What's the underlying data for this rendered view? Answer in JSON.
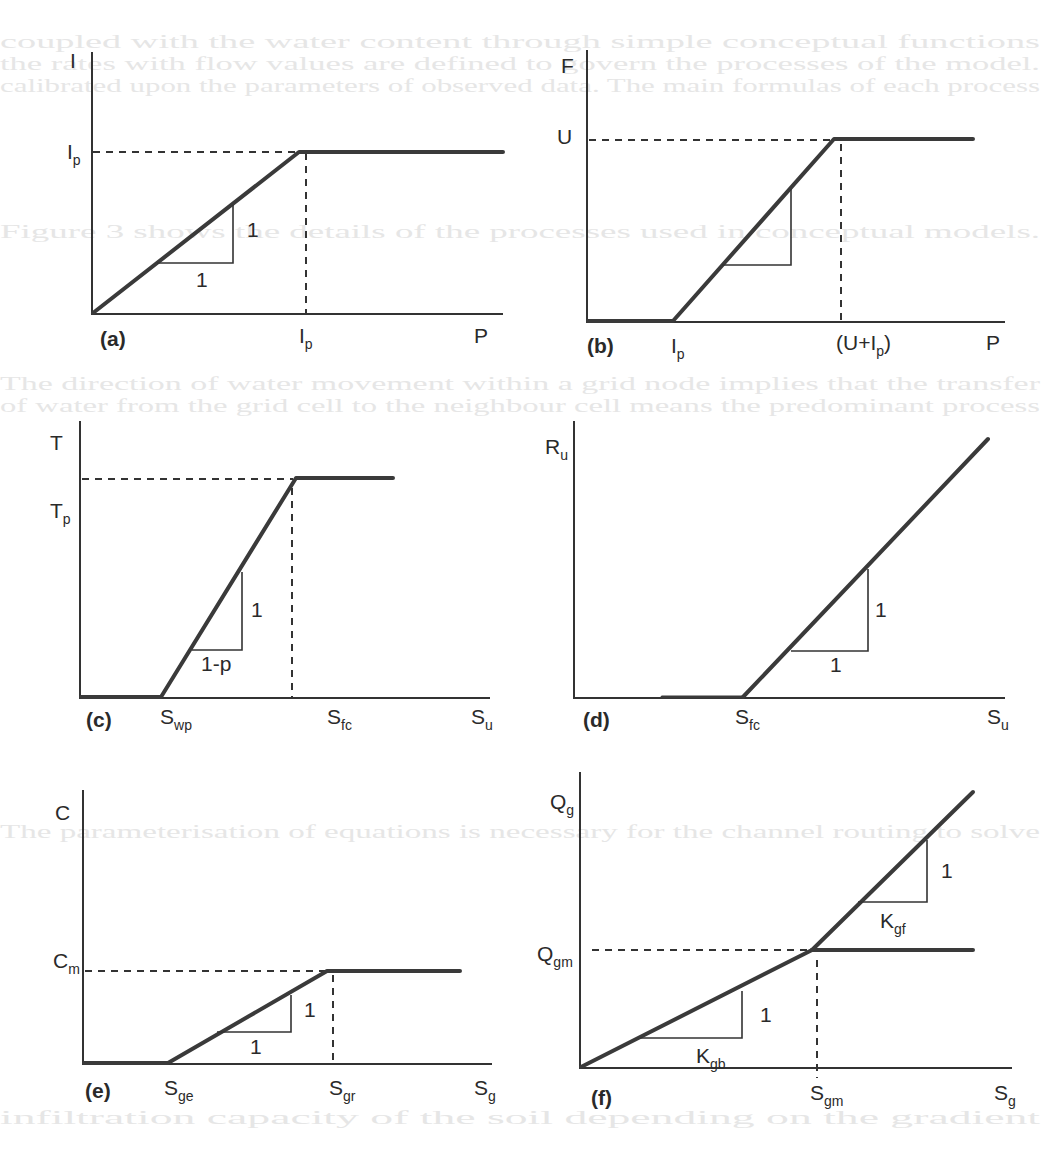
{
  "background_bleed": [
    {
      "x": 0,
      "y": 48,
      "text": "coupled with the water content through simple conceptual functions"
    },
    {
      "x": 0,
      "y": 70,
      "text": "the rates with flow values are defined to govern the processes of the model."
    },
    {
      "x": 0,
      "y": 92,
      "text": "calibrated upon the parameters of observed data. The main formulas of each process"
    },
    {
      "x": 0,
      "y": 238,
      "text": "Figure 3 shows the details of the processes used in conceptual models."
    },
    {
      "x": 0,
      "y": 390,
      "text": "The direction of water movement within a grid node implies that the transfer"
    },
    {
      "x": 0,
      "y": 412,
      "text": "of water from the grid cell to the neighbour cell means the predominant process"
    },
    {
      "x": 0,
      "y": 838,
      "text": "The parameterisation of equations is necessary for the channel routing to solve"
    },
    {
      "x": 0,
      "y": 1124,
      "text": "infiltration capacity of the soil depending on the gradient"
    }
  ],
  "chart_data": [
    {
      "id": "a",
      "type": "line",
      "panel_label": "(a)",
      "ylabel": "I",
      "xlabel": "P",
      "y_ticks": [
        {
          "label": "I",
          "sub": "p"
        }
      ],
      "x_ticks": [
        {
          "label": "I",
          "sub": "p"
        }
      ],
      "description": "Interception I vs precipitation P: slope 1 from origin until I = Ip at P = Ip, then constant Ip",
      "points": [
        [
          0,
          0
        ],
        [
          1,
          1
        ],
        [
          1.65,
          1
        ]
      ],
      "slope_triangles": [
        {
          "rise": "1",
          "run": "1"
        }
      ],
      "xlim": [
        0,
        1.7
      ],
      "ylim": [
        0,
        1.35
      ]
    },
    {
      "id": "b",
      "type": "line",
      "panel_label": "(b)",
      "ylabel": "F",
      "xlabel": "P",
      "y_ticks": [
        {
          "label": "U",
          "sub": ""
        }
      ],
      "x_ticks": [
        {
          "label": "I",
          "sub": "p"
        },
        {
          "label": "(U+I",
          "sub": "p",
          "suffix": ")"
        }
      ],
      "description": "Infiltration F vs precipitation P: zero until P = Ip, slope 1 until F = U at P = U+Ip, then constant U",
      "points": [
        [
          0,
          0
        ],
        [
          0.35,
          0
        ],
        [
          1,
          1
        ],
        [
          1.6,
          1
        ]
      ],
      "slope_triangles": [
        {
          "rise": "",
          "run": ""
        }
      ],
      "xlim": [
        0,
        1.7
      ],
      "ylim": [
        0,
        1.2
      ]
    },
    {
      "id": "c",
      "type": "line",
      "panel_label": "(c)",
      "ylabel": "T",
      "xlabel": "S",
      "y_ticks": [
        {
          "label": "T",
          "sub": "p"
        }
      ],
      "x_ticks": [
        {
          "label": "S",
          "sub": "wp"
        },
        {
          "label": "S",
          "sub": "fc"
        },
        {
          "label": "S",
          "sub": "u"
        }
      ],
      "description": "Transpiration T vs soil storage S: zero below Swp, linear with slope 1/(1-p) until Tp, constant above Sfc",
      "points": [
        [
          0,
          0
        ],
        [
          0.38,
          0
        ],
        [
          1,
          1
        ],
        [
          1.46,
          1
        ]
      ],
      "slope_triangles": [
        {
          "rise": "1",
          "run": "1-p"
        }
      ],
      "xlim": [
        0,
        1.9
      ],
      "ylim": [
        0,
        1.28
      ]
    },
    {
      "id": "d",
      "type": "line",
      "panel_label": "(d)",
      "ylabel": "R",
      "ylabel_sub": "u",
      "xlabel": "S",
      "y_ticks": [],
      "x_ticks": [
        {
          "label": "S",
          "sub": "fc"
        },
        {
          "label": "S",
          "sub": "u"
        }
      ],
      "description": "Recharge Ru vs soil storage S: zero below Sfc, slope 1 above Sfc",
      "points": [
        [
          0,
          0
        ],
        [
          0.39,
          0
        ],
        [
          1,
          1
        ]
      ],
      "slope_triangles": [
        {
          "rise": "1",
          "run": "1"
        }
      ],
      "xlim": [
        0,
        1.05
      ],
      "ylim": [
        0,
        1.07
      ]
    },
    {
      "id": "e",
      "type": "line",
      "panel_label": "(e)",
      "ylabel": "C",
      "xlabel": "S",
      "y_ticks": [
        {
          "label": "C",
          "sub": "m"
        }
      ],
      "x_ticks": [
        {
          "label": "S",
          "sub": "ge"
        },
        {
          "label": "S",
          "sub": "gr"
        },
        {
          "label": "S",
          "sub": "g"
        }
      ],
      "description": "Capillary rise C vs groundwater storage Sg: zero below Sge, slope 1 until Cm at Sgr, constant above",
      "points": [
        [
          0,
          0
        ],
        [
          0.35,
          0
        ],
        [
          1,
          1
        ],
        [
          1.54,
          1
        ]
      ],
      "slope_triangles": [
        {
          "rise": "1",
          "run": "1"
        }
      ],
      "xlim": [
        0,
        1.67
      ],
      "ylim": [
        0,
        2.9
      ]
    },
    {
      "id": "f",
      "type": "line",
      "panel_label": "(f)",
      "ylabel": "Q",
      "ylabel_sub": "g",
      "xlabel": "S",
      "y_ticks": [
        {
          "label": "Q",
          "sub": "gm"
        }
      ],
      "x_ticks": [
        {
          "label": "S",
          "sub": "gm"
        },
        {
          "label": "S",
          "sub": "g"
        }
      ],
      "description": "Groundwater discharge Qg vs Sg: slope Kgb until Qgm at Sgm; beyond, two branches — constant Qgm or slope Kgf",
      "series": [
        {
          "name": "base",
          "points": [
            [
              0,
              0
            ],
            [
              1,
              1
            ]
          ]
        },
        {
          "name": "capped",
          "points": [
            [
              1,
              1
            ],
            [
              1.7,
              1
            ]
          ]
        },
        {
          "name": "fast",
          "points": [
            [
              1,
              1
            ],
            [
              1.7,
              2.35
            ]
          ]
        }
      ],
      "slope_triangles": [
        {
          "rise": "1",
          "run": "K",
          "run_sub": "gb"
        },
        {
          "rise": "1",
          "run": "K",
          "run_sub": "gf"
        }
      ],
      "xlim": [
        0,
        1.85
      ],
      "ylim": [
        0,
        2.5
      ]
    }
  ],
  "labels": {
    "a": {
      "y": "I",
      "x": "P",
      "panel": "(a)",
      "ytick": "I",
      "ytick_sub": "p",
      "xtick": "I",
      "xtick_sub": "p",
      "tri_rise": "1",
      "tri_run": "1"
    },
    "b": {
      "y": "F",
      "x": "P",
      "panel": "(b)",
      "ytick": "U",
      "xtick1": "I",
      "xtick1_sub": "p",
      "xtick2": "(U+I",
      "xtick2_sub": "p",
      "xtick2_end": ")"
    },
    "c": {
      "y": "T",
      "x": "S",
      "x_sub": "u",
      "panel": "(c)",
      "ytick": "T",
      "ytick_sub": "p",
      "xtick1": "S",
      "xtick1_sub": "wp",
      "xtick2": "S",
      "xtick2_sub": "fc",
      "tri_rise": "1",
      "tri_run": "1-p"
    },
    "d": {
      "y": "R",
      "y_sub": "u",
      "x": "S",
      "x_sub": "u",
      "panel": "(d)",
      "xtick1": "S",
      "xtick1_sub": "fc",
      "tri_rise": "1",
      "tri_run": "1"
    },
    "e": {
      "y": "C",
      "x": "S",
      "x_sub": "g",
      "panel": "(e)",
      "ytick": "C",
      "ytick_sub": "m",
      "xtick1": "S",
      "xtick1_sub": "ge",
      "xtick2": "S",
      "xtick2_sub": "gr",
      "tri_rise": "1",
      "tri_run": "1"
    },
    "f": {
      "y": "Q",
      "y_sub": "g",
      "x": "S",
      "x_sub": "g",
      "panel": "(f)",
      "ytick": "Q",
      "ytick_sub": "gm",
      "xtick1": "S",
      "xtick1_sub": "gm",
      "tri1_rise": "1",
      "tri1_run": "K",
      "tri1_run_sub": "gb",
      "tri2_rise": "1",
      "tri2_run": "K",
      "tri2_run_sub": "gf"
    }
  }
}
